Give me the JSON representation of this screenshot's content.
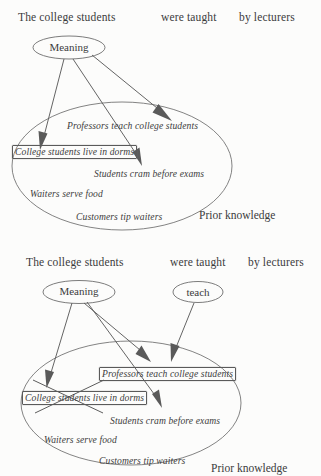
{
  "figure": {
    "background_color": "#fcfcfb",
    "ink_color": "#3b3b3b",
    "line_color": "#5c5c5c"
  },
  "panels": [
    {
      "id": "panel-top",
      "sentence": {
        "parts": [
          {
            "text": "The college students"
          },
          {
            "text": "were taught"
          },
          {
            "text": "by lecturers"
          }
        ]
      },
      "nodes": [
        {
          "id": "meaning",
          "label": "Meaning"
        }
      ],
      "region": {
        "label": "Prior knowledge",
        "propositions": [
          {
            "id": "professors",
            "text": "Professors teach college students",
            "boxed": false,
            "crossed_out": false
          },
          {
            "id": "dorms",
            "text": "College students live in dorms",
            "boxed": true,
            "crossed_out": false
          },
          {
            "id": "cram",
            "text": "Students cram before exams",
            "boxed": false,
            "crossed_out": false
          },
          {
            "id": "waiters",
            "text": "Waiters serve food",
            "boxed": false,
            "crossed_out": false
          },
          {
            "id": "customers",
            "text": "Customers tip waiters",
            "boxed": false,
            "crossed_out": false
          }
        ]
      },
      "arrows": [
        {
          "from": "meaning",
          "to": "dorms"
        },
        {
          "from": "meaning",
          "to": "cram"
        },
        {
          "from": "meaning",
          "to": "region-right"
        }
      ]
    },
    {
      "id": "panel-bottom",
      "sentence": {
        "parts": [
          {
            "text": "The college students"
          },
          {
            "text": "were taught"
          },
          {
            "text": "by lecturers"
          }
        ]
      },
      "nodes": [
        {
          "id": "meaning",
          "label": "Meaning"
        },
        {
          "id": "teach",
          "label": "teach"
        }
      ],
      "region": {
        "label": "Prior knowledge",
        "propositions": [
          {
            "id": "professors",
            "text": "Professors teach college students",
            "boxed": true,
            "crossed_out": false
          },
          {
            "id": "dorms",
            "text": "College students live in dorms",
            "boxed": true,
            "crossed_out": true
          },
          {
            "id": "cram",
            "text": "Students cram before exams",
            "boxed": false,
            "crossed_out": false
          },
          {
            "id": "waiters",
            "text": "Waiters serve food",
            "boxed": false,
            "crossed_out": false
          },
          {
            "id": "customers",
            "text": "Customers tip waiters",
            "boxed": false,
            "crossed_out": false
          }
        ]
      },
      "arrows": [
        {
          "from": "meaning",
          "to": "dorms"
        },
        {
          "from": "meaning",
          "to": "professors"
        },
        {
          "from": "meaning",
          "to": "cram"
        },
        {
          "from": "teach",
          "to": "professors"
        }
      ]
    }
  ]
}
